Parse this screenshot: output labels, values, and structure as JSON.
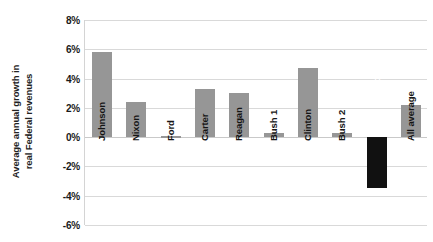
{
  "chart_data": {
    "type": "bar",
    "title": "",
    "subtitle": "",
    "xlabel": "",
    "ylabel": "Average annual growth in real Federal revenues",
    "ylabel_lines": [
      "Average annual growth in",
      "real Federal revenues"
    ],
    "categories": [
      "Johnson",
      "Nixon",
      "Ford",
      "Carter",
      "Reagan",
      "Bush 1",
      "Clinton",
      "Bush 2",
      "Obama",
      "All average"
    ],
    "values": [
      5.8,
      2.4,
      0.05,
      3.3,
      3.0,
      0.3,
      4.7,
      0.3,
      -3.5,
      2.2
    ],
    "value_labels": [
      "5.8%",
      "2.4%",
      "0.0%",
      "3.3%",
      "3.0%",
      "0.3%",
      "4.7%",
      "0.3%",
      "-3.5%",
      "2.2%"
    ],
    "ylim": [
      -6,
      8
    ],
    "ytick_values": [
      8,
      6,
      4,
      2,
      0,
      -2,
      -4,
      -6
    ],
    "ytick_labels": [
      "8%",
      "6%",
      "4%",
      "2%",
      "0%",
      "-2%",
      "-4%",
      "-6%"
    ],
    "grid": true,
    "legend": "none",
    "highlight_category": "Obama",
    "bar_color": "#969696",
    "highlight_color": "#111111",
    "grid_color": "#d9d9d9",
    "background_color": "#ffffff"
  }
}
